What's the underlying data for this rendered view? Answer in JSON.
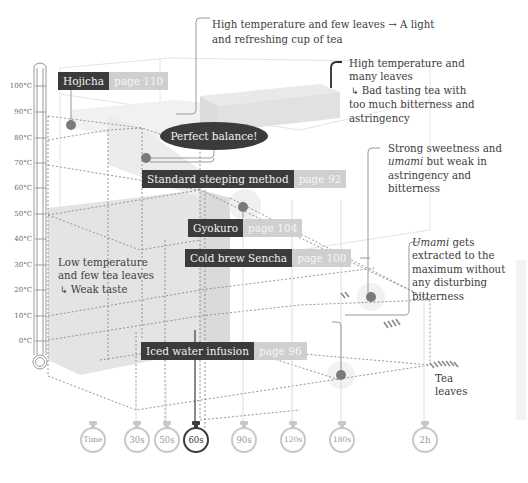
{
  "thermometer": {
    "ticks": [
      "100°C",
      "90°C",
      "80°C",
      "70°C",
      "60°C",
      "50°C",
      "40°C",
      "30°C",
      "20°C",
      "10°C",
      "0°C"
    ]
  },
  "time_axis": {
    "label": "Time",
    "ticks": [
      "30s",
      "50s",
      "60s",
      "90s",
      "120s",
      "180s",
      "2h"
    ],
    "highlighted": "60s"
  },
  "leaves_axis": {
    "label_line1": "Tea",
    "label_line2": "leaves"
  },
  "tags": {
    "hojicha": {
      "name": "Hojicha",
      "page": "page 110"
    },
    "standard": {
      "name": "Standard steeping method",
      "page": "page 92"
    },
    "gyokuro": {
      "name": "Gyokuro",
      "page": "page 104"
    },
    "cold_brew": {
      "name": "Cold brew Sencha",
      "page": "page 100"
    },
    "iced": {
      "name": "Iced water infusion",
      "page": "page 96"
    }
  },
  "bubble": {
    "text": "Perfect balance!"
  },
  "notes": {
    "high_few": {
      "line1": "High temperature and few leaves → A light",
      "line2": "and refreshing cup of tea"
    },
    "high_many": {
      "line1": "High temperature and",
      "line2": "many leaves",
      "arrow": "↳",
      "line3": "Bad tasting tea with",
      "line4": "too much bitterness and",
      "line5": "astringency"
    },
    "gyokuro_note": {
      "line1": "Strong sweetness and",
      "line2_em": "umami",
      "line2_rest": " but weak in",
      "line3": "astringency and",
      "line4": "bitterness"
    },
    "cold_brew_note": {
      "line1_em": "Umami",
      "line1_rest": " gets",
      "line2": "extracted to the",
      "line3": "maximum without",
      "line4": "any disturbing",
      "line5": "bitterness"
    },
    "low_few": {
      "line1": "Low temperature",
      "line2": "and few tea leaves",
      "arrow": "↳",
      "line3": "Weak taste"
    }
  },
  "colors": {
    "dark": "#3b3b3b",
    "page_tag": "#cfcfcf",
    "box_fill": "#e6e6e6",
    "dot": "#7a7a7a",
    "grid": "#8a8a8a"
  }
}
